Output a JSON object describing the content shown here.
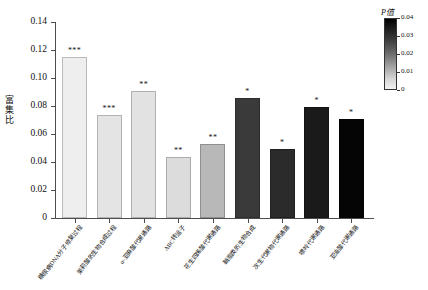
{
  "chart_data": {
    "type": "bar",
    "title": "",
    "xlabel": "",
    "ylabel": "富集比",
    "ylim": [
      0,
      0.14
    ],
    "ytick_labels": [
      "0",
      "0.02",
      "0.04",
      "0.06",
      "0.08",
      "0.10",
      "0.12",
      "0.14"
    ],
    "ytick_values": [
      0,
      0.02,
      0.04,
      0.06,
      0.08,
      0.1,
      0.12,
      0.14
    ],
    "grid": false,
    "categories": [
      "糖尿病DNA分子修复过程",
      "茉莉酸的生物合成过程",
      "α-亚麻酸代谢通路",
      "ABC转运子",
      "花生四烯酸代谢通路",
      "鞘脂类的生物合成",
      "次生代谢物代谢通路",
      "嘌呤代谢通路",
      "亚油酸代谢通路"
    ],
    "values": [
      0.115,
      0.0735,
      0.0905,
      0.0435,
      0.053,
      0.086,
      0.0495,
      0.0795,
      0.0705
    ],
    "significance": [
      "***",
      "***",
      "**",
      "**",
      "**",
      "*",
      "*",
      "*",
      "*"
    ],
    "bar_colors": [
      "#eeeeee",
      "#e4e4e4",
      "#e2e2e2",
      "#dcdcdc",
      "#b8b8b8",
      "#3a3a3a",
      "#2b2b2b",
      "#1a1a1a",
      "#050505"
    ],
    "p_values": [
      0.002,
      0.003,
      0.006,
      0.007,
      0.012,
      0.03,
      0.033,
      0.037,
      0.04
    ],
    "legend": {
      "position": "right",
      "title": "P值",
      "title_italic_part": "P",
      "title_rest": "值",
      "ticks": [
        "0.04",
        "0.03",
        "0.02",
        "0.01",
        "0"
      ],
      "tick_values": [
        0.04,
        0.03,
        0.02,
        0.01,
        0
      ],
      "range": [
        0,
        0.04
      ],
      "colormap": "grayscale-dark-high"
    }
  }
}
